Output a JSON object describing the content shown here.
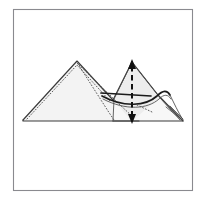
{
  "figure": {
    "kind": "origami-fold-step-diagram",
    "title": "Origami folding step diagram",
    "canvas": {
      "width": 206,
      "height": 208,
      "background": "#ffffff"
    },
    "frame": {
      "name": "diagram-border",
      "x": 13,
      "y": 9,
      "width": 180,
      "height": 182,
      "stroke": "#8a8a8f",
      "fill": "#ffffff",
      "stroke_width": 1.1
    },
    "palette": {
      "paper_fill": "#f3f3f3",
      "paper_fill_light": "#f7f7f7",
      "paper_fill_mid": "#ededed",
      "edge_stroke": "#3a3a3a",
      "dotted_stroke": "#5a5a5a",
      "fold_arrow": "#111111",
      "frame_stroke": "#8a8a8f"
    },
    "key_points": {
      "left_tip": [
        23,
        120
      ],
      "left_apex": [
        77,
        61
      ],
      "center_valley": [
        113,
        99
      ],
      "right_apex": [
        132,
        62
      ],
      "right_tip": [
        183,
        121
      ],
      "baseline_y": 121,
      "horizontal_crease_y": 97
    },
    "elements": {
      "left_triangle_label": "left folded triangle panel",
      "right_peak_label": "right folded peak panel",
      "vertical_fold_label": "vertical valley-fold axis",
      "horizontal_crease_label": "horizontal crease line",
      "curved_flap_label": "curved lifted flap at right tip",
      "hidden_edge_label": "hidden edge shown dotted"
    },
    "annotations": {
      "fold_direction": "vertical double-headed arrow through right peak",
      "arrow_head_count": 2,
      "dotted_line_meaning": "hidden / underlying edge",
      "dashed_line_meaning": "fold line"
    },
    "visible_text": []
  }
}
